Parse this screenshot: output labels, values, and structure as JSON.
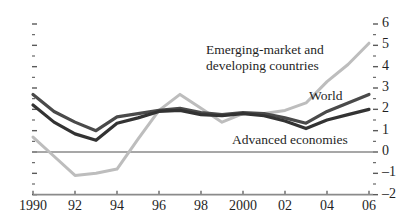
{
  "chart_data": {
    "type": "line",
    "title": "",
    "subtitle": "",
    "xlabel": "",
    "ylabel": "",
    "xlim": [
      1990,
      2006
    ],
    "ylim": [
      -2,
      6
    ],
    "x": [
      1990,
      1991,
      1992,
      1993,
      1994,
      1995,
      1996,
      1997,
      1998,
      1999,
      2000,
      2001,
      2002,
      2003,
      2004,
      2005,
      2006
    ],
    "x_tick_labels": [
      "1990",
      "92",
      "94",
      "96",
      "98",
      "2000",
      "02",
      "04",
      "06"
    ],
    "x_tick_values": [
      1990,
      1992,
      1994,
      1996,
      1998,
      2000,
      2002,
      2004,
      2006
    ],
    "y_tick_labels": [
      "6",
      "5",
      "4",
      "3",
      "2",
      "1",
      "0",
      "-1",
      "-2"
    ],
    "y_tick_values": [
      6,
      5,
      4,
      3,
      2,
      1,
      0,
      -1,
      -2
    ],
    "y_minor_step": 0.5,
    "grid": false,
    "zero_line": true,
    "axis_position": "right",
    "legend_position": "inline-annotations",
    "series": [
      {
        "name": "Emerging-market and developing countries",
        "color": "#bdbdbd",
        "values": [
          0.7,
          -0.2,
          -1.1,
          -1.0,
          -0.8,
          0.6,
          1.95,
          2.7,
          2.05,
          1.4,
          1.8,
          1.8,
          1.95,
          2.3,
          3.3,
          4.1,
          5.1
        ]
      },
      {
        "name": "World",
        "color": "#4a4a4a",
        "values": [
          2.7,
          1.9,
          1.4,
          1.0,
          1.65,
          1.8,
          1.95,
          2.05,
          1.85,
          1.75,
          1.85,
          1.8,
          1.6,
          1.35,
          1.9,
          2.3,
          2.7
        ]
      },
      {
        "name": "Advanced economies",
        "color": "#333333",
        "values": [
          2.2,
          1.4,
          0.85,
          0.55,
          1.35,
          1.6,
          1.9,
          1.95,
          1.75,
          1.7,
          1.8,
          1.7,
          1.45,
          1.1,
          1.5,
          1.75,
          2.0
        ]
      }
    ],
    "annotations": [
      {
        "name": "emerging-label",
        "line1": "Emerging-market and",
        "line2": "developing countries"
      },
      {
        "name": "world-label",
        "text": "World"
      },
      {
        "name": "advanced-label",
        "text": "Advanced economies"
      }
    ]
  }
}
